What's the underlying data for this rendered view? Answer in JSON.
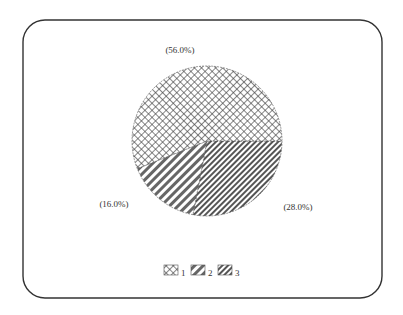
{
  "chart_data": {
    "type": "pie",
    "title": "",
    "categories": [
      "1",
      "2",
      "3"
    ],
    "values": [
      56.0,
      16.0,
      28.0
    ],
    "labels": [
      "(56.0%)",
      "(16.0%)",
      "(28.0%)"
    ],
    "patterns": [
      "crosshatch",
      "diagonal-wide",
      "diagonal-dense"
    ],
    "legend": {
      "position": "bottom",
      "entries": [
        "1",
        "2",
        "3"
      ]
    },
    "start_angle_deg": 0,
    "direction": "clockwise-from-right, order 3,2,1"
  },
  "frame": {
    "border_color": "#333333",
    "corner_radius": 22
  }
}
